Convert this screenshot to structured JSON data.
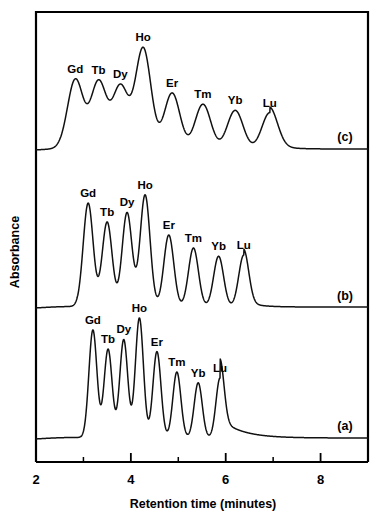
{
  "figure": {
    "background_color": "#ffffff",
    "line_color": "#111111",
    "frame_color": "#000000"
  },
  "axes": {
    "x_title": "Retention time (minutes)",
    "y_title": "Absorbance",
    "x_major_ticks": [
      "2",
      "4",
      "6",
      "8"
    ],
    "x_minor_ticks": [
      "3",
      "5",
      "7",
      "9"
    ]
  },
  "trace_tags": {
    "top": "(c)",
    "middle": "(b)",
    "bottom": "(a)"
  },
  "chart_data": {
    "type": "line",
    "title": "",
    "xlabel": "Retention time (minutes)",
    "ylabel": "Absorbance",
    "xlim": [
      2,
      9
    ],
    "grid": false,
    "legend": "none",
    "analytes": [
      "Gd",
      "Tb",
      "Dy",
      "Ho",
      "Er",
      "Tm",
      "Yb",
      "Lu"
    ],
    "series": [
      {
        "name": "(c)",
        "panel": "top",
        "baseline_y": 0,
        "peak_width": 0.165,
        "start_rise_x": 2.52,
        "peaks": [
          {
            "label": "Gd",
            "x": 2.83,
            "height": 0.62
          },
          {
            "label": "Tb",
            "x": 3.32,
            "height": 0.6
          },
          {
            "label": "Dy",
            "x": 3.78,
            "height": 0.555
          },
          {
            "label": "Ho",
            "x": 4.26,
            "height": 0.9
          },
          {
            "label": "Er",
            "x": 4.87,
            "height": 0.5
          },
          {
            "label": "Tm",
            "x": 5.52,
            "height": 0.4
          },
          {
            "label": "Yb",
            "x": 6.2,
            "height": 0.345
          },
          {
            "label": "Lu",
            "x": 6.93,
            "height": 0.325
          }
        ]
      },
      {
        "name": "(b)",
        "panel": "middle",
        "baseline_y": 0,
        "peak_width": 0.105,
        "start_rise_x": 2.88,
        "peaks": [
          {
            "label": "Gd",
            "x": 3.1,
            "height": 0.88
          },
          {
            "label": "Tb",
            "x": 3.5,
            "height": 0.72
          },
          {
            "label": "Dy",
            "x": 3.92,
            "height": 0.8
          },
          {
            "label": "Ho",
            "x": 4.3,
            "height": 0.95
          },
          {
            "label": "Er",
            "x": 4.8,
            "height": 0.61
          },
          {
            "label": "Tm",
            "x": 5.32,
            "height": 0.5
          },
          {
            "label": "Yb",
            "x": 5.85,
            "height": 0.43
          },
          {
            "label": "Lu",
            "x": 6.38,
            "height": 0.44
          }
        ]
      },
      {
        "name": "(a)",
        "panel": "bottom",
        "baseline_y": 0,
        "peak_width": 0.085,
        "start_rise_x": 2.95,
        "peaks": [
          {
            "label": "Gd",
            "x": 3.2,
            "height": 0.9
          },
          {
            "label": "Tb",
            "x": 3.52,
            "height": 0.74
          },
          {
            "label": "Dy",
            "x": 3.85,
            "height": 0.82
          },
          {
            "label": "Ho",
            "x": 4.18,
            "height": 1.0
          },
          {
            "label": "Er",
            "x": 4.55,
            "height": 0.72
          },
          {
            "label": "Tm",
            "x": 4.97,
            "height": 0.55
          },
          {
            "label": "Yb",
            "x": 5.42,
            "height": 0.46
          },
          {
            "label": "Lu",
            "x": 5.88,
            "height": 0.5
          }
        ]
      }
    ]
  }
}
